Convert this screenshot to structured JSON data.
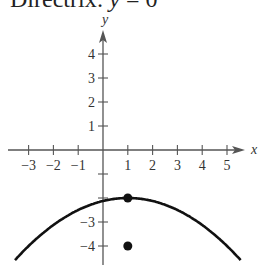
{
  "title": {
    "prefix": "Directrix:",
    "var": "y",
    "rest": " = 0"
  },
  "chart_data": {
    "type": "line",
    "title": "Directrix: y = 0",
    "xlabel": "x",
    "ylabel": "y",
    "xlim": [
      -3.5,
      6
    ],
    "ylim": [
      -4.5,
      5
    ],
    "x_ticks": [
      -3,
      -2,
      -1,
      1,
      2,
      3,
      4,
      5
    ],
    "x_tick_labels": [
      "−3",
      "−2",
      "−1",
      "1",
      "2",
      "3",
      "4",
      "5"
    ],
    "y_ticks": [
      4,
      3,
      2,
      1,
      -1,
      -2,
      -3,
      -4
    ],
    "y_tick_labels": [
      "4",
      "3",
      "2",
      "1",
      "",
      "",
      "−3",
      "−4"
    ],
    "grid": false,
    "series": [
      {
        "name": "parabola",
        "equation": "(x-1)^2 = -8(y+2)",
        "x": [
          -3.5,
          -3,
          -2,
          -1,
          0,
          1,
          2,
          3,
          4,
          5,
          5.5
        ],
        "y": [
          -4.53,
          -4.0,
          -3.125,
          -2.5,
          -2.125,
          -2,
          -2.125,
          -2.5,
          -3.125,
          -4.0,
          -4.53
        ]
      },
      {
        "name": "vertex",
        "type": "point",
        "x": 1,
        "y": -2
      },
      {
        "name": "focus",
        "type": "point",
        "x": 1,
        "y": -4
      }
    ]
  }
}
